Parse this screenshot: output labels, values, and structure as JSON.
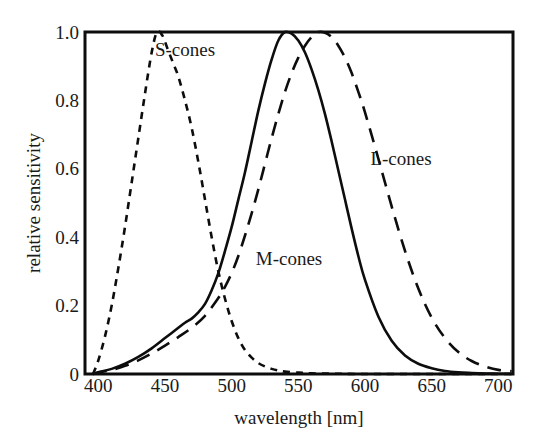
{
  "chart_data": {
    "type": "line",
    "title": "",
    "xlabel": "wavelength [nm]",
    "ylabel": "relative sensitivity",
    "xlim": [
      390,
      711
    ],
    "ylim": [
      0,
      1.0
    ],
    "grid": false,
    "legend_position": "inline-annotations",
    "xticks": [
      400,
      450,
      500,
      550,
      600,
      650,
      700
    ],
    "xtick_labels": [
      "400",
      "450",
      "500",
      "550",
      "600",
      "650",
      "700"
    ],
    "yticks": [
      0,
      0.2,
      0.4,
      0.6,
      0.8,
      1.0
    ],
    "ytick_labels": [
      "0",
      "0.2",
      "0.4",
      "0.6",
      "0.8",
      "1.0"
    ],
    "annotations": [
      {
        "text": "S-cones",
        "x": 465,
        "y": 0.93
      },
      {
        "text": "M-cones",
        "x": 543,
        "y": 0.32
      },
      {
        "text": "L-cones",
        "x": 627,
        "y": 0.61
      }
    ],
    "series": [
      {
        "name": "S-cones",
        "style": "short-dashed",
        "color": "#0d0d0d",
        "peak_wavelength": 444,
        "x": [
          396,
          400,
          405,
          410,
          415,
          420,
          425,
          430,
          435,
          440,
          444,
          448,
          452,
          456,
          460,
          465,
          470,
          475,
          480,
          485,
          490,
          495,
          500,
          505,
          510,
          515,
          520,
          525,
          530,
          535,
          540,
          550,
          560,
          575,
          600,
          650,
          700,
          710
        ],
        "values": [
          0.0,
          0.04,
          0.11,
          0.2,
          0.31,
          0.43,
          0.56,
          0.69,
          0.82,
          0.94,
          1.0,
          0.99,
          0.95,
          0.91,
          0.87,
          0.8,
          0.72,
          0.62,
          0.51,
          0.4,
          0.3,
          0.22,
          0.155,
          0.105,
          0.07,
          0.048,
          0.032,
          0.022,
          0.015,
          0.01,
          0.007,
          0.004,
          0.002,
          0.001,
          0.0,
          0.0,
          0.0,
          0.0
        ]
      },
      {
        "name": "M-cones",
        "style": "solid",
        "color": "#0d0d0d",
        "peak_wavelength": 540,
        "x": [
          396,
          400,
          410,
          420,
          430,
          440,
          450,
          455,
          460,
          465,
          470,
          475,
          480,
          485,
          490,
          495,
          500,
          505,
          510,
          515,
          520,
          525,
          530,
          535,
          540,
          545,
          550,
          555,
          560,
          565,
          570,
          575,
          580,
          585,
          590,
          595,
          600,
          610,
          620,
          630,
          640,
          650,
          660,
          670,
          680,
          690,
          700,
          710
        ],
        "values": [
          0.0,
          0.005,
          0.015,
          0.03,
          0.05,
          0.075,
          0.105,
          0.12,
          0.135,
          0.15,
          0.162,
          0.18,
          0.205,
          0.245,
          0.295,
          0.36,
          0.43,
          0.51,
          0.59,
          0.68,
          0.77,
          0.85,
          0.92,
          0.975,
          1.0,
          0.995,
          0.975,
          0.94,
          0.89,
          0.83,
          0.76,
          0.68,
          0.595,
          0.51,
          0.425,
          0.345,
          0.275,
          0.168,
          0.097,
          0.054,
          0.03,
          0.017,
          0.009,
          0.005,
          0.003,
          0.0015,
          0.0008,
          0.0005
        ]
      },
      {
        "name": "L-cones",
        "style": "long-dashed",
        "color": "#0d0d0d",
        "peak_wavelength": 565,
        "x": [
          396,
          400,
          410,
          420,
          430,
          440,
          450,
          460,
          470,
          480,
          490,
          495,
          500,
          505,
          510,
          515,
          520,
          525,
          530,
          535,
          540,
          545,
          550,
          555,
          560,
          565,
          570,
          575,
          580,
          585,
          590,
          595,
          600,
          610,
          620,
          630,
          640,
          650,
          660,
          670,
          680,
          690,
          700,
          710
        ],
        "values": [
          0.0,
          0.004,
          0.012,
          0.024,
          0.04,
          0.06,
          0.083,
          0.108,
          0.135,
          0.17,
          0.222,
          0.255,
          0.295,
          0.345,
          0.405,
          0.47,
          0.54,
          0.615,
          0.69,
          0.76,
          0.825,
          0.88,
          0.925,
          0.96,
          0.985,
          1.0,
          0.998,
          0.985,
          0.96,
          0.925,
          0.88,
          0.825,
          0.765,
          0.63,
          0.49,
          0.36,
          0.25,
          0.165,
          0.105,
          0.064,
          0.038,
          0.022,
          0.012,
          0.008
        ]
      }
    ]
  },
  "figure": {
    "background": "#ffffff",
    "ink_color": "#0d0d0d"
  }
}
